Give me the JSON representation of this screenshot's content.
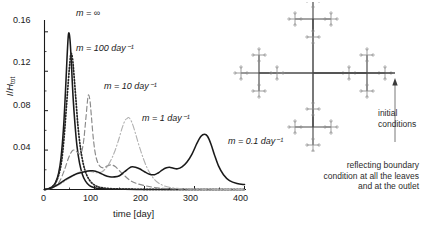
{
  "figure": {
    "title": "",
    "axis": {
      "xlabel": "time [day]",
      "ylabel_num": "I",
      "ylabel_den": "H",
      "ylabel_sub": "tot",
      "xticks": [
        "0",
        "100",
        "200",
        "300",
        "400"
      ],
      "yticks": [
        "0.04",
        "0.08",
        "0.12",
        "0.16"
      ]
    },
    "curve_labels": [
      {
        "id": "m-infinity",
        "text": "m = ∞"
      },
      {
        "id": "m-100",
        "text": "m = 100 day⁻¹"
      },
      {
        "id": "m-10",
        "text": "m = 10 day⁻¹"
      },
      {
        "id": "m-1",
        "text": "m = 1 day⁻¹"
      },
      {
        "id": "m-0.1",
        "text": "m = 0.1 day⁻¹"
      }
    ],
    "diagram": {
      "initial_conditions_line1": "initial",
      "initial_conditions_line2": "conditions",
      "boundary_line1": "reflecting boundary",
      "boundary_line2": "condition at all the leaves",
      "boundary_line3": "and at the outlet"
    },
    "colors": {
      "axis": "#1a1a1a",
      "curve_infinity": "#1a1a1a",
      "curve_100": "#262626",
      "curve_10": "#8a8a8a",
      "curve_1": "#b0b0b0",
      "curve_01": "#1a1a1a",
      "tree_major": "#4a4a4a",
      "tree_minor": "#8d8d8d",
      "text": "#2b2b2b"
    }
  },
  "chart_data": {
    "type": "line",
    "title": "",
    "xlabel": "time [day]",
    "ylabel": "I/H_tot",
    "xlim": [
      0,
      400
    ],
    "ylim": [
      0,
      0.172
    ],
    "xticks": [
      0,
      100,
      200,
      300,
      400
    ],
    "yticks": [
      0.04,
      0.08,
      0.12,
      0.16
    ],
    "grid": false,
    "legend": "inline-annotations",
    "series": [
      {
        "name": "m = ∞",
        "style": "solid",
        "color": "#1a1a1a",
        "peak": {
          "x": 48,
          "y": 0.158
        },
        "x": [
          0,
          8,
          16,
          22,
          28,
          33,
          38,
          42,
          45,
          48,
          51,
          54,
          57,
          61,
          65,
          70,
          76,
          82,
          90,
          100,
          112,
          125,
          140,
          160,
          185,
          220,
          260,
          320,
          400
        ],
        "y": [
          0.0,
          0.0008,
          0.003,
          0.007,
          0.016,
          0.032,
          0.062,
          0.1,
          0.133,
          0.158,
          0.152,
          0.126,
          0.095,
          0.066,
          0.044,
          0.027,
          0.015,
          0.0085,
          0.004,
          0.0018,
          0.0009,
          0.0005,
          0.0003,
          0.0002,
          0.0001,
          0.0001,
          0.0,
          0.0,
          0.0
        ]
      },
      {
        "name": "m = 100 day⁻¹",
        "style": "dotted",
        "color": "#262626",
        "peak": {
          "x": 53,
          "y": 0.138
        },
        "x": [
          0,
          8,
          16,
          22,
          28,
          34,
          39,
          44,
          48,
          51,
          53,
          56,
          59,
          63,
          67,
          72,
          78,
          85,
          94,
          105,
          118,
          133,
          150,
          175,
          205,
          245,
          300,
          400
        ],
        "y": [
          0.0,
          0.0007,
          0.0028,
          0.0065,
          0.014,
          0.028,
          0.052,
          0.085,
          0.112,
          0.13,
          0.138,
          0.133,
          0.116,
          0.09,
          0.064,
          0.042,
          0.025,
          0.014,
          0.007,
          0.0032,
          0.0016,
          0.0008,
          0.0005,
          0.0003,
          0.0002,
          0.0001,
          0.0,
          0.0
        ]
      },
      {
        "name": "m = 10 day⁻¹",
        "style": "dashed",
        "color": "#8a8a8a",
        "peak": {
          "x": 88,
          "y": 0.096
        },
        "secondary_shoulder": {
          "x": 60,
          "y": 0.04
        },
        "x": [
          0,
          10,
          20,
          30,
          40,
          48,
          55,
          60,
          65,
          70,
          74,
          78,
          82,
          86,
          88,
          91,
          94,
          98,
          103,
          110,
          118,
          126,
          134,
          142,
          150,
          160,
          172,
          185,
          200,
          215,
          230,
          260,
          300,
          400
        ],
        "y": [
          0.0,
          0.0008,
          0.003,
          0.008,
          0.02,
          0.032,
          0.039,
          0.04,
          0.038,
          0.036,
          0.038,
          0.048,
          0.068,
          0.09,
          0.096,
          0.09,
          0.073,
          0.05,
          0.033,
          0.024,
          0.022,
          0.024,
          0.025,
          0.023,
          0.019,
          0.014,
          0.009,
          0.006,
          0.004,
          0.0025,
          0.0015,
          0.0006,
          0.0002,
          0.0
        ]
      },
      {
        "name": "m = 1 day⁻¹",
        "style": "dashdot",
        "color": "#b0b0b0",
        "peak": {
          "x": 168,
          "y": 0.073
        },
        "x": [
          0,
          15,
          30,
          45,
          60,
          72,
          84,
          95,
          105,
          115,
          125,
          133,
          140,
          148,
          155,
          161,
          165,
          168,
          172,
          177,
          183,
          190,
          198,
          206,
          214,
          222,
          230,
          240,
          252,
          265,
          280,
          300,
          330,
          400
        ],
        "y": [
          0.0,
          0.0015,
          0.005,
          0.01,
          0.015,
          0.018,
          0.019,
          0.018,
          0.017,
          0.018,
          0.023,
          0.03,
          0.038,
          0.05,
          0.062,
          0.07,
          0.072,
          0.073,
          0.071,
          0.065,
          0.055,
          0.043,
          0.031,
          0.021,
          0.014,
          0.009,
          0.006,
          0.0035,
          0.002,
          0.0012,
          0.0007,
          0.0004,
          0.0002,
          0.0
        ]
      },
      {
        "name": "m = 0.1 day⁻¹",
        "style": "solid",
        "color": "#1a1a1a",
        "peak": {
          "x": 320,
          "y": 0.056
        },
        "bumps": [
          {
            "x": 95,
            "y": 0.019
          },
          {
            "x": 175,
            "y": 0.023
          },
          {
            "x": 245,
            "y": 0.022
          }
        ],
        "x": [
          0,
          15,
          30,
          45,
          60,
          72,
          84,
          92,
          96,
          102,
          110,
          120,
          130,
          140,
          150,
          160,
          170,
          176,
          182,
          190,
          200,
          210,
          220,
          228,
          236,
          244,
          250,
          258,
          266,
          275,
          285,
          295,
          305,
          313,
          320,
          326,
          333,
          340,
          348,
          358,
          370,
          385,
          400
        ],
        "y": [
          0.0,
          0.0018,
          0.006,
          0.011,
          0.015,
          0.017,
          0.0185,
          0.019,
          0.019,
          0.0185,
          0.017,
          0.0145,
          0.013,
          0.0128,
          0.014,
          0.018,
          0.022,
          0.023,
          0.0225,
          0.021,
          0.018,
          0.0155,
          0.015,
          0.017,
          0.02,
          0.022,
          0.0225,
          0.0215,
          0.021,
          0.023,
          0.028,
          0.036,
          0.047,
          0.054,
          0.056,
          0.054,
          0.046,
          0.035,
          0.024,
          0.015,
          0.009,
          0.006,
          0.005
        ]
      }
    ]
  }
}
